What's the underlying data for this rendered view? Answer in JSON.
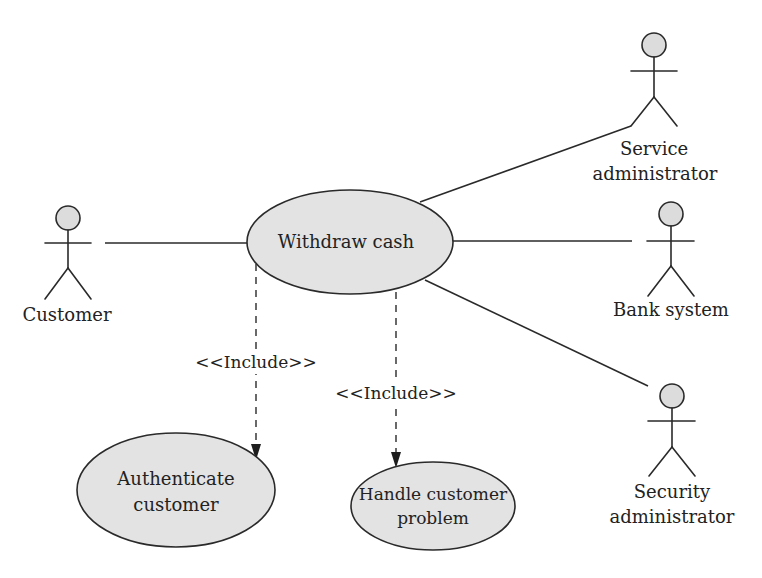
{
  "diagram": {
    "type": "uml-use-case",
    "colors": {
      "usecase_fill": "#e3e3e3",
      "actor_head_fill": "#dcdcdc",
      "stroke": "#2a2a2a",
      "text": "#222222",
      "background": "#ffffff"
    },
    "usecases": {
      "withdraw": {
        "label": "Withdraw cash"
      },
      "authenticate": {
        "label_line1": "Authenticate",
        "label_line2": "customer"
      },
      "handle_problem": {
        "label_line1": "Handle customer",
        "label_line2": "problem"
      }
    },
    "actors": {
      "customer": {
        "label": "Customer"
      },
      "service_admin": {
        "label_line1": "Service",
        "label_line2": "administrator"
      },
      "bank_system": {
        "label": "Bank system"
      },
      "security_admin": {
        "label_line1": "Security",
        "label_line2": "administrator"
      }
    },
    "relationships": {
      "include_authenticate": {
        "label": "<<Include>>"
      },
      "include_handle_problem": {
        "label": "<<Include>>"
      }
    }
  }
}
